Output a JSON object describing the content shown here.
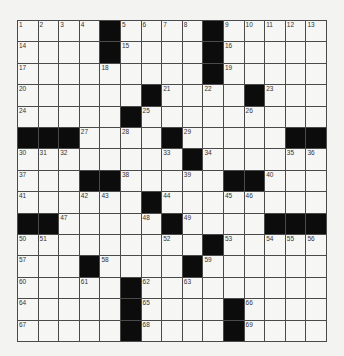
{
  "puzzle": {
    "rows": 15,
    "cols": 15,
    "colors": {
      "background": "#f3f3f1",
      "cell": "#f6f6f4",
      "block": "#0c0c0c",
      "grid_line": "#4a4a4a",
      "number": "#333333"
    },
    "grid": [
      [
        "1",
        "2",
        "3",
        "4",
        "#",
        "5",
        "6",
        "7",
        "8",
        "#",
        "9",
        "10",
        "11",
        "12",
        "13"
      ],
      [
        "14",
        "",
        "",
        "",
        "#",
        "15",
        "",
        "",
        "",
        "#",
        "16",
        "",
        "",
        "",
        ""
      ],
      [
        "17",
        "",
        "",
        "",
        "18",
        "",
        "",
        "",
        "",
        "#",
        "19",
        "",
        "",
        "",
        ""
      ],
      [
        "20",
        "",
        "",
        "",
        "",
        "",
        "#",
        "21",
        "",
        "22",
        "",
        "#",
        "23",
        "",
        ""
      ],
      [
        "24",
        "",
        "",
        "",
        "",
        "#",
        "25",
        "",
        "",
        "",
        "",
        "26",
        "",
        "",
        ""
      ],
      [
        "#",
        "#",
        "#",
        "27",
        "",
        "28",
        "",
        "#",
        "29",
        "",
        "",
        "",
        "",
        "#",
        "#"
      ],
      [
        "30",
        "31",
        "32",
        "",
        "",
        "",
        "",
        "33",
        "#",
        "34",
        "",
        "",
        "",
        "35",
        "36"
      ],
      [
        "37",
        "",
        "",
        "#",
        "#",
        "38",
        "",
        "",
        "39",
        "",
        "#",
        "#",
        "40",
        "",
        ""
      ],
      [
        "41",
        "",
        "",
        "42",
        "43",
        "",
        "#",
        "44",
        "",
        "",
        "45",
        "46",
        "",
        "",
        ""
      ],
      [
        "#",
        "#",
        "47",
        "",
        "",
        "",
        "48",
        "#",
        "49",
        "",
        "",
        "",
        "#",
        "#",
        "#"
      ],
      [
        "50",
        "51",
        "",
        "",
        "",
        "",
        "",
        "52",
        "",
        "#",
        "53",
        "",
        "54",
        "55",
        "56"
      ],
      [
        "57",
        "",
        "",
        "#",
        "58",
        "",
        "",
        "",
        "#",
        "59",
        "",
        "",
        "",
        "",
        ""
      ],
      [
        "60",
        "",
        "",
        "61",
        "",
        "#",
        "62",
        "",
        "63",
        "",
        "",
        "",
        "",
        "",
        ""
      ],
      [
        "64",
        "",
        "",
        "",
        "",
        "#",
        "65",
        "",
        "",
        "",
        "#",
        "66",
        "",
        "",
        ""
      ],
      [
        "67",
        "",
        "",
        "",
        "",
        "#",
        "68",
        "",
        "",
        "",
        "#",
        "69",
        "",
        "",
        ""
      ]
    ]
  }
}
